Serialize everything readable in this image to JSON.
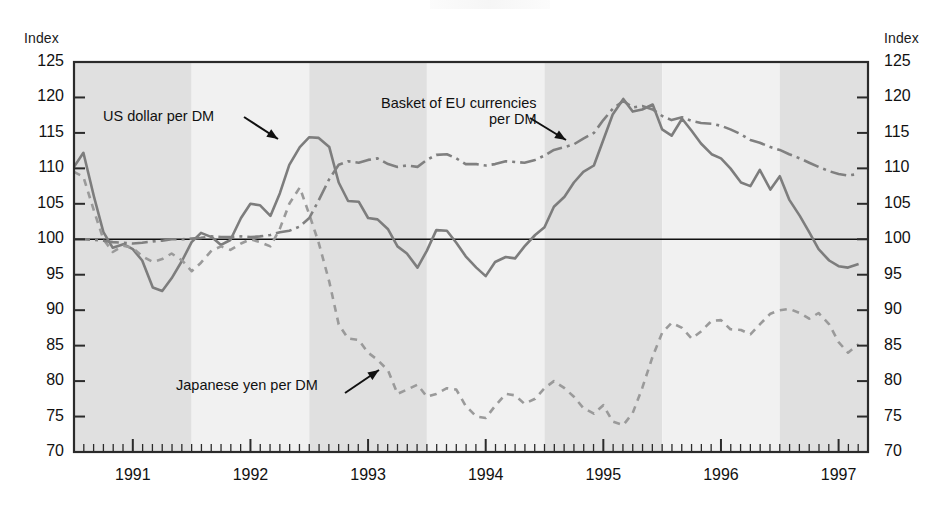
{
  "figure": {
    "y_axis_title_left": "Index",
    "y_axis_title_right": "Index",
    "annotations": {
      "usd": "US dollar per DM",
      "eu_line1": "Basket of EU currencies",
      "eu_line2": "per DM",
      "jpy": "Japanese yen per DM"
    }
  },
  "colors": {
    "line_usd": "#7d7d7d",
    "line_jpy": "#9a9a9a",
    "line_eu": "#808080",
    "band_dark": "#e0e0e0",
    "band_light": "#f1f1f1",
    "frame": "#2b2b2b",
    "reference_line": "#111111"
  },
  "chart_data": {
    "type": "line",
    "title": "",
    "subtitle": "",
    "xlabel": "",
    "ylabel": "Index",
    "ylim": [
      70,
      125
    ],
    "yticks": [
      70,
      75,
      80,
      85,
      90,
      95,
      100,
      105,
      110,
      115,
      120,
      125
    ],
    "xlim": [
      1990.5,
      1997.25
    ],
    "xticks": [
      1991,
      1992,
      1993,
      1994,
      1995,
      1996,
      1997
    ],
    "xtick_labels": [
      "1991",
      "1992",
      "1993",
      "1994",
      "1995",
      "1996",
      "1997"
    ],
    "minor_xticks_per_year": 12,
    "grid": false,
    "legend": "annotated-inline",
    "reference_line_y": 100,
    "shaded_bands": [
      {
        "from": 1990.5,
        "to": 1991.5,
        "tone": "dark"
      },
      {
        "from": 1991.5,
        "to": 1992.5,
        "tone": "light"
      },
      {
        "from": 1992.5,
        "to": 1993.5,
        "tone": "dark"
      },
      {
        "from": 1993.5,
        "to": 1994.5,
        "tone": "light"
      },
      {
        "from": 1994.5,
        "to": 1995.5,
        "tone": "dark"
      },
      {
        "from": 1995.5,
        "to": 1996.5,
        "tone": "light"
      },
      {
        "from": 1996.5,
        "to": 1997.25,
        "tone": "dark"
      }
    ],
    "x": [
      1990.5,
      1990.58,
      1990.67,
      1990.75,
      1990.83,
      1990.92,
      1991.0,
      1991.08,
      1991.17,
      1991.25,
      1991.33,
      1991.42,
      1991.5,
      1991.58,
      1991.67,
      1991.75,
      1991.83,
      1991.92,
      1992.0,
      1992.08,
      1992.17,
      1992.25,
      1992.33,
      1992.42,
      1992.5,
      1992.58,
      1992.67,
      1992.75,
      1992.83,
      1992.92,
      1993.0,
      1993.08,
      1993.17,
      1993.25,
      1993.33,
      1993.42,
      1993.5,
      1993.58,
      1993.67,
      1993.75,
      1993.83,
      1993.92,
      1994.0,
      1994.08,
      1994.17,
      1994.25,
      1994.33,
      1994.42,
      1994.5,
      1994.58,
      1994.67,
      1994.75,
      1994.83,
      1994.92,
      1995.0,
      1995.08,
      1995.17,
      1995.25,
      1995.33,
      1995.42,
      1995.5,
      1995.58,
      1995.67,
      1995.75,
      1995.83,
      1995.92,
      1996.0,
      1996.08,
      1996.17,
      1996.25,
      1996.33,
      1996.42,
      1996.5,
      1996.58,
      1996.67,
      1996.75,
      1996.83,
      1996.92,
      1997.0,
      1997.08,
      1997.17
    ],
    "series": [
      {
        "name": "US dollar per DM",
        "style": "solid",
        "color": "#7d7d7d",
        "values": [
          110.2,
          112.2,
          106.0,
          101.0,
          98.8,
          99.3,
          98.6,
          97.0,
          93.2,
          92.7,
          94.5,
          97.0,
          99.6,
          100.9,
          100.3,
          99.2,
          99.9,
          103.0,
          105.0,
          104.8,
          103.3,
          106.5,
          110.5,
          113.0,
          114.4,
          114.3,
          113.0,
          108.0,
          105.4,
          105.3,
          103.0,
          102.8,
          101.4,
          99.0,
          98.0,
          96.0,
          98.4,
          101.3,
          101.2,
          99.5,
          97.6,
          96.0,
          94.8,
          96.8,
          97.5,
          97.3,
          99.0,
          100.6,
          101.7,
          104.6,
          106.0,
          108.0,
          109.5,
          110.4,
          114.0,
          117.6,
          119.8,
          118.0,
          118.3,
          119.0,
          115.5,
          114.6,
          117.0,
          115.3,
          113.5,
          112.0,
          111.4,
          110.0,
          108.0,
          107.5,
          109.8,
          107.0,
          108.9,
          105.6,
          103.3,
          101.0,
          98.6,
          97.0,
          96.2,
          96.0,
          96.5
        ]
      },
      {
        "name": "Japanese yen per DM",
        "style": "dashed",
        "color": "#9a9a9a",
        "values": [
          109.5,
          108.8,
          104.0,
          100.0,
          98.2,
          99.1,
          98.8,
          97.6,
          96.8,
          97.2,
          98.0,
          97.0,
          95.5,
          96.7,
          98.4,
          99.0,
          98.5,
          99.4,
          100.0,
          99.6,
          99.0,
          101.5,
          105.0,
          107.3,
          103.5,
          99.5,
          94.0,
          88.0,
          86.0,
          85.8,
          84.0,
          83.0,
          81.5,
          78.2,
          78.8,
          79.5,
          77.8,
          78.2,
          79.0,
          78.8,
          76.5,
          75.0,
          74.8,
          76.5,
          78.2,
          78.0,
          76.8,
          77.5,
          79.0,
          80.0,
          79.0,
          77.8,
          76.2,
          75.4,
          76.6,
          74.3,
          73.8,
          75.5,
          79.0,
          83.5,
          86.8,
          88.2,
          87.5,
          86.0,
          87.0,
          88.5,
          88.6,
          87.3,
          87.2,
          86.6,
          88.0,
          89.5,
          90.0,
          90.2,
          89.6,
          88.8,
          89.6,
          88.0,
          85.5,
          84.0,
          85.2
        ]
      },
      {
        "name": "Basket of EU currencies per DM",
        "style": "dashdot",
        "color": "#808080",
        "values": [
          100.0,
          100.0,
          99.9,
          99.8,
          99.6,
          99.5,
          99.4,
          99.5,
          99.7,
          99.8,
          100.0,
          100.0,
          100.1,
          100.2,
          100.4,
          100.3,
          100.3,
          100.4,
          100.3,
          100.4,
          100.6,
          101.0,
          101.2,
          101.8,
          103.0,
          105.5,
          108.5,
          110.5,
          111.0,
          110.8,
          111.2,
          111.4,
          110.6,
          110.2,
          110.4,
          110.2,
          111.2,
          111.9,
          112.0,
          111.4,
          110.6,
          110.6,
          110.4,
          110.6,
          111.0,
          110.9,
          110.8,
          111.2,
          111.8,
          112.6,
          113.0,
          113.4,
          114.2,
          115.0,
          116.8,
          118.4,
          119.5,
          118.6,
          118.8,
          118.3,
          117.4,
          116.8,
          117.2,
          116.7,
          116.4,
          116.3,
          116.0,
          115.5,
          114.8,
          114.0,
          113.6,
          113.0,
          112.6,
          112.0,
          111.4,
          110.8,
          110.2,
          109.6,
          109.2,
          109.0,
          109.2
        ]
      }
    ]
  }
}
